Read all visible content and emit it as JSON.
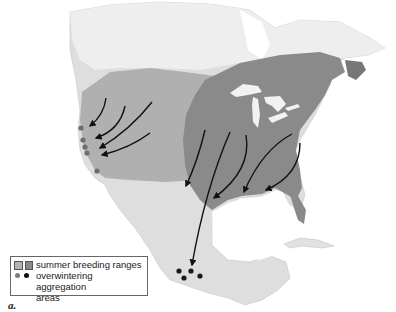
{
  "map": {
    "subject": "Monarch butterfly migration, North America",
    "colors": {
      "land": "#dcdcdc",
      "land_light": "#ececec",
      "western_range": "#a9a9a9",
      "eastern_range": "#8a8a8a",
      "water": "#ffffff",
      "arrow": "#111111",
      "dot_western": "#6e6e6e",
      "dot_eastern": "#1a1a1a"
    },
    "western_dots": [
      [
        80,
        128
      ],
      [
        82,
        140
      ],
      [
        84,
        147
      ],
      [
        86,
        153
      ],
      [
        97,
        171
      ]
    ],
    "mexico_dots": [
      [
        178,
        272
      ],
      [
        190,
        271
      ],
      [
        183,
        278
      ],
      [
        199,
        276
      ]
    ]
  },
  "legend": {
    "row1_label": "summer breeding ranges",
    "row2_label": "overwintering aggregation",
    "row2_label_cont": "areas",
    "swatch_light": "#b4b4b4",
    "swatch_dark": "#8a8a8a",
    "dot_light": "#7a7a7a",
    "dot_dark": "#111111"
  },
  "figure_label": "a."
}
